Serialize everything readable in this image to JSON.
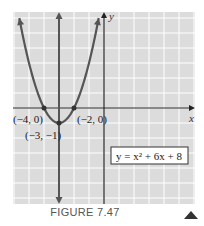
{
  "figure": {
    "caption": "FIGURE 7.47",
    "nav_icon": "triangle-up-icon"
  },
  "colors": {
    "grid_bg": "#dcdcdc",
    "grid_line": "#ffffff",
    "axis": "#222222",
    "curve": "#555555"
  },
  "chart_data": {
    "type": "line",
    "title": "",
    "xlabel": "x",
    "ylabel": "y",
    "equation": "y = x² + 6x + 8",
    "function": {
      "a": 1,
      "b": 6,
      "c": 8
    },
    "axis_of_symmetry": -3,
    "xlim": [
      -6,
      6
    ],
    "ylim": [
      -6,
      6.5
    ],
    "grid": true,
    "annotations": [
      {
        "label": "(−4, 0)",
        "x": -4,
        "y": 0
      },
      {
        "label": "(−2, 0)",
        "x": -2,
        "y": 0
      },
      {
        "label": "(−3, −1)",
        "x": -3,
        "y": -1
      }
    ]
  }
}
